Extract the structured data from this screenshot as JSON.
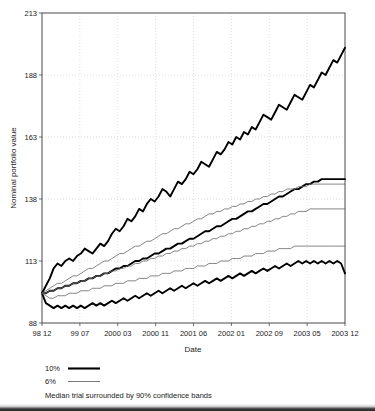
{
  "chart_data": {
    "type": "line",
    "title": "",
    "xlabel": "Date",
    "ylabel": "Nominal portfolio value",
    "ylim": [
      88,
      213
    ],
    "yticks": [
      88,
      113,
      138,
      163,
      188,
      213
    ],
    "xtick_labels": [
      "98 12",
      "99 07",
      "2000 03",
      "2000 11",
      "2001 06",
      "2002 01",
      "2002 09",
      "2003 05",
      "2003 12"
    ],
    "grid": true,
    "legend_position": "below-axes",
    "legend": [
      {
        "label": "10%",
        "style": "thick-black-line"
      },
      {
        "label": "6%",
        "style": "thin-gray-line"
      }
    ],
    "caption": "Median trial surrounded by 90% confidence bands",
    "series": [
      {
        "name": "10% upper 95th percentile",
        "style": "thick",
        "values": [
          100,
          103,
          106,
          110,
          112,
          111,
          113,
          114,
          113,
          115,
          116,
          118,
          117,
          116,
          118,
          120,
          119,
          121,
          124,
          126,
          125,
          127,
          130,
          129,
          131,
          134,
          133,
          136,
          138,
          137,
          139,
          142,
          141,
          139,
          142,
          145,
          144,
          146,
          149,
          148,
          150,
          153,
          152,
          151,
          154,
          157,
          156,
          158,
          161,
          160,
          163,
          162,
          165,
          164,
          167,
          166,
          169,
          172,
          171,
          170,
          173,
          176,
          175,
          174,
          177,
          180,
          179,
          178,
          181,
          184,
          183,
          186,
          189,
          188,
          191,
          194,
          193,
          196,
          199
        ]
      },
      {
        "name": "10% median",
        "style": "thick",
        "values": [
          100,
          100,
          101,
          101,
          102,
          102,
          103,
          103,
          104,
          104,
          105,
          105,
          106,
          106,
          107,
          107,
          108,
          108,
          109,
          110,
          110,
          111,
          111,
          112,
          113,
          113,
          114,
          114,
          115,
          116,
          116,
          117,
          118,
          118,
          119,
          120,
          120,
          121,
          122,
          122,
          123,
          124,
          125,
          125,
          126,
          127,
          127,
          128,
          129,
          130,
          130,
          131,
          132,
          133,
          133,
          134,
          135,
          136,
          136,
          137,
          138,
          139,
          139,
          140,
          141,
          142,
          142,
          143,
          144,
          144,
          145,
          145,
          146,
          146,
          146,
          146,
          146,
          146,
          146
        ]
      },
      {
        "name": "10% lower 5th percentile",
        "style": "thick",
        "values": [
          100,
          96,
          95,
          94,
          95,
          94,
          95,
          94,
          95,
          94,
          95,
          94,
          95,
          96,
          95,
          96,
          95,
          96,
          97,
          96,
          97,
          98,
          97,
          98,
          99,
          98,
          99,
          100,
          99,
          100,
          101,
          100,
          101,
          102,
          101,
          102,
          103,
          102,
          103,
          104,
          103,
          104,
          105,
          104,
          105,
          106,
          105,
          106,
          107,
          106,
          107,
          108,
          107,
          108,
          109,
          108,
          109,
          110,
          109,
          110,
          111,
          110,
          111,
          112,
          111,
          112,
          113,
          112,
          113,
          112,
          113,
          112,
          113,
          112,
          113,
          112,
          113,
          112,
          108
        ]
      },
      {
        "name": "6% upper 95th percentile",
        "style": "thin",
        "values": [
          100,
          101,
          102,
          103,
          104,
          104,
          105,
          106,
          107,
          107,
          108,
          109,
          110,
          110,
          111,
          112,
          113,
          113,
          114,
          115,
          116,
          116,
          117,
          118,
          119,
          119,
          120,
          121,
          121,
          122,
          123,
          124,
          124,
          125,
          126,
          126,
          127,
          128,
          128,
          129,
          130,
          130,
          131,
          132,
          132,
          133,
          133,
          134,
          134,
          135,
          135,
          136,
          136,
          137,
          137,
          138,
          138,
          139,
          139,
          140,
          140,
          141,
          141,
          142,
          142,
          142,
          143,
          143,
          143,
          144,
          144,
          144,
          144,
          144,
          144,
          144,
          144,
          144,
          144
        ]
      },
      {
        "name": "6% median",
        "style": "thin",
        "values": [
          100,
          100,
          101,
          101,
          102,
          102,
          103,
          103,
          104,
          104,
          105,
          105,
          106,
          106,
          107,
          107,
          108,
          108,
          109,
          109,
          110,
          110,
          111,
          111,
          112,
          112,
          113,
          113,
          114,
          114,
          115,
          115,
          116,
          116,
          117,
          117,
          118,
          118,
          119,
          119,
          120,
          120,
          121,
          121,
          122,
          122,
          123,
          123,
          124,
          124,
          125,
          125,
          126,
          126,
          127,
          127,
          128,
          128,
          129,
          129,
          130,
          130,
          131,
          131,
          132,
          132,
          133,
          133,
          133,
          134,
          134,
          134,
          134,
          134,
          134,
          134,
          134,
          134,
          134
        ]
      },
      {
        "name": "6% lower 5th percentile",
        "style": "thin",
        "values": [
          100,
          99,
          98,
          98,
          99,
          99,
          99,
          100,
          100,
          100,
          101,
          101,
          101,
          102,
          102,
          102,
          103,
          103,
          103,
          104,
          104,
          104,
          105,
          105,
          105,
          106,
          106,
          106,
          107,
          107,
          107,
          108,
          108,
          108,
          109,
          109,
          109,
          110,
          110,
          110,
          111,
          111,
          111,
          112,
          112,
          112,
          113,
          113,
          113,
          114,
          114,
          114,
          115,
          115,
          115,
          116,
          116,
          116,
          117,
          117,
          117,
          118,
          118,
          118,
          118,
          119,
          119,
          119,
          119,
          119,
          119,
          119,
          119,
          119,
          119,
          119,
          119,
          119,
          119
        ]
      }
    ]
  }
}
